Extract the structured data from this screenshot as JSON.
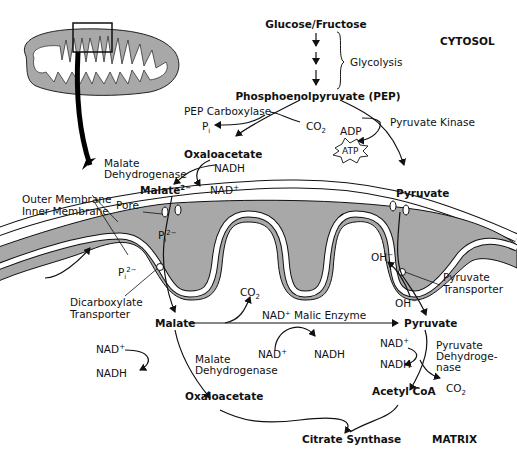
{
  "regions": {
    "cytosol": "CYTOSOL",
    "matrix": "MATRIX"
  },
  "glycolysis": {
    "start": "Glucose/Fructose",
    "label": "Glycolysis",
    "product": "Phosphoenolpyruvate (PEP)"
  },
  "cytosol_reactions": {
    "pep_carboxylase": "PEP Carboxylase",
    "pi": "P",
    "pi_sub": "i",
    "co2": "CO",
    "co2_sub": "2",
    "oxaloacetate": "Oxaloacetate",
    "mdh_label_line1": "Malate",
    "mdh_label_line2": "Dehydrogenase",
    "nadh": "NADH",
    "nad_plus": "NAD",
    "nad_plus_sup": "+",
    "malate": "Malate",
    "malate_sup": "2−",
    "pyruvate_kinase": "Pyruvate Kinase",
    "adp": "ADP",
    "atp": "ATP",
    "pyruvate": "Pyruvate"
  },
  "membrane": {
    "outer": "Outer Membrane",
    "inner": "Inner Membrane",
    "pore": "Pore",
    "pi_inside": "P",
    "pi_inside_sub": "i",
    "pi_inside_sup": "2−",
    "pi_outside": "P",
    "pi_outside_sub": "i",
    "pi_outside_sup": "2−",
    "dicarboxylate_line1": "Dicarboxylate",
    "dicarboxylate_line2": "Transporter",
    "oh_inside": "OH",
    "oh_inside_sup": "−",
    "oh_outside": "OH",
    "oh_outside_sup": "−",
    "pyruvate_transporter_line1": "Pyruvate",
    "pyruvate_transporter_line2": "Transporter"
  },
  "matrix_reactions": {
    "malate": "Malate",
    "co2": "CO",
    "co2_sub": "2",
    "malic_enzyme": "NAD⁺ Malic Enzyme",
    "nad_plus_mid": "NAD",
    "nad_plus_mid_sup": "+",
    "nadh_mid": "NADH",
    "pyruvate": "Pyruvate",
    "nad_plus_left": "NAD",
    "nad_plus_left_sup": "+",
    "nadh_left": "NADH",
    "mdh_line1": "Malate",
    "mdh_line2": "Dehydrogenase",
    "oxaloacetate": "Oxaloacetate",
    "nad_plus_right": "NAD",
    "nad_plus_right_sup": "+",
    "nadh_right": "NADH",
    "pdh_line1": "Pyruvate",
    "pdh_line2": "Dehydroge-",
    "pdh_line3": "nase",
    "co2_right": "CO",
    "co2_right_sub": "2",
    "acetyl_coa": "Acetyl CoA",
    "citrate_synthase": "Citrate Synthase"
  },
  "colors": {
    "membrane_gray": "#a8a8a8",
    "line": "#111111",
    "background": "#ffffff"
  }
}
